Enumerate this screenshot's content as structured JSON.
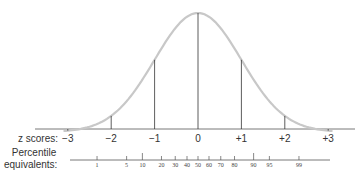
{
  "chart_data": {
    "type": "line",
    "title": "",
    "xlabel": "z scores:",
    "percentile_label_line1": "Percentile",
    "percentile_label_line2": "equivalents:",
    "z_scores": [
      "−3",
      "−2",
      "−1",
      "0",
      "+1",
      "+2",
      "+3"
    ],
    "z_values": [
      -3,
      -2,
      -1,
      0,
      1,
      2,
      3
    ],
    "percentiles": [
      "1",
      "5",
      "10",
      "20",
      "30",
      "40",
      "50",
      "60",
      "70",
      "80",
      "90",
      "95",
      "99"
    ],
    "percentile_values": [
      1,
      5,
      10,
      20,
      30,
      40,
      50,
      60,
      70,
      80,
      90,
      95,
      99
    ],
    "grid": false,
    "curve_color": "#c8c8c8",
    "line_color": "#333333"
  }
}
